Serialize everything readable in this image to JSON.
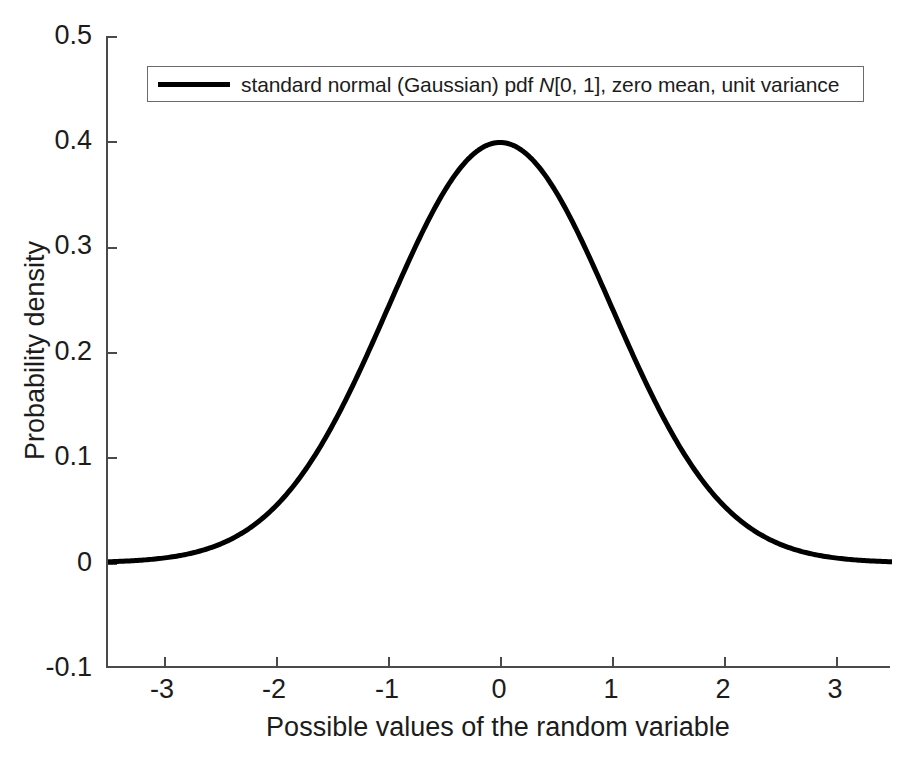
{
  "chart_data": {
    "type": "line",
    "title": "",
    "xlabel": "Possible values of the random variable",
    "ylabel": "Probability density",
    "xlim": [
      -3.5,
      3.5
    ],
    "ylim": [
      -0.1,
      0.5
    ],
    "grid": false,
    "legend_position": "upper center",
    "xticks": [
      "-3",
      "-2",
      "-1",
      "0",
      "1",
      "2",
      "3"
    ],
    "xtick_values": [
      -3,
      -2,
      -1,
      0,
      1,
      2,
      3
    ],
    "yticks": [
      "-0.1",
      "0",
      "0.1",
      "0.2",
      "0.3",
      "0.4",
      "0.5"
    ],
    "ytick_values": [
      -0.1,
      0,
      0.1,
      0.2,
      0.3,
      0.4,
      0.5
    ],
    "series": [
      {
        "name": "standard normal (Gaussian) pdf N[0, 1], zero mean, unit variance",
        "color": "#000000",
        "linewidth": 5,
        "distribution": "normal",
        "mean": 0,
        "variance": 1,
        "peak_value": 0.3989,
        "x": [
          -3.5,
          -3.25,
          -3,
          -2.75,
          -2.5,
          -2.25,
          -2,
          -1.75,
          -1.5,
          -1.25,
          -1,
          -0.75,
          -0.5,
          -0.25,
          0,
          0.25,
          0.5,
          0.75,
          1,
          1.25,
          1.5,
          1.75,
          2,
          2.25,
          2.5,
          2.75,
          3,
          3.25,
          3.5
        ],
        "y": [
          0.0009,
          0.002,
          0.0044,
          0.0091,
          0.0175,
          0.0317,
          0.054,
          0.0863,
          0.1295,
          0.1826,
          0.242,
          0.3011,
          0.3521,
          0.3867,
          0.3989,
          0.3867,
          0.3521,
          0.3011,
          0.242,
          0.1826,
          0.1295,
          0.0863,
          0.054,
          0.0317,
          0.0175,
          0.0091,
          0.0044,
          0.002,
          0.0009
        ]
      }
    ]
  },
  "legend": {
    "entries": [
      {
        "label_prefix": "standard normal (Gaussian) pdf ",
        "label_variable": "N",
        "label_suffix": "[0, 1], zero mean, unit variance",
        "swatch": "line-swatch-black"
      }
    ]
  },
  "colors": {
    "background": "#ffffff",
    "axis": "#4a4a4a",
    "text": "#1c1c1c",
    "curve": "#000000",
    "legend_border": "#6b6b6b"
  }
}
